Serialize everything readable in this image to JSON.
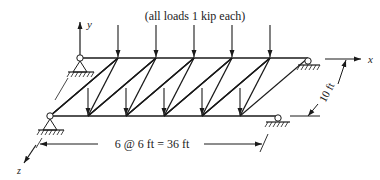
{
  "title": "(all loads 1 kip each)",
  "axes": {
    "x": "x",
    "y": "y",
    "z": "z"
  },
  "dimensions": {
    "span": "6 @ 6 ft  =  36 ft",
    "depth": "10 ft"
  },
  "truss": {
    "panels": 6,
    "panel_length_ft": 6,
    "total_length_ft": 36,
    "width_ft": 10,
    "load_kip": 1,
    "back_chord_loads": 5,
    "front_chord_loads": 5
  },
  "supports": {
    "back_left": "pin",
    "back_right": "roller",
    "front_left": "pin",
    "front_right": "roller"
  },
  "colors": {
    "ink": "#1a1a1a",
    "background": "#ffffff"
  }
}
